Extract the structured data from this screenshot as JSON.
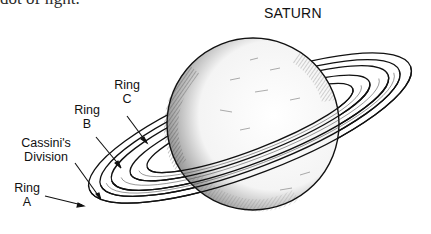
{
  "caption": {
    "partial_text": "dot of light."
  },
  "diagram": {
    "title": "SATURN",
    "labels": [
      {
        "id": "ring-c",
        "line1": "Ring",
        "line2": "C"
      },
      {
        "id": "ring-b",
        "line1": "Ring",
        "line2": "B"
      },
      {
        "id": "cassini-division",
        "line1": "Cassini's",
        "line2": "Division"
      },
      {
        "id": "ring-a",
        "line1": "Ring",
        "line2": "A"
      }
    ],
    "colors": {
      "ink": "#111111",
      "background": "#ffffff"
    }
  }
}
